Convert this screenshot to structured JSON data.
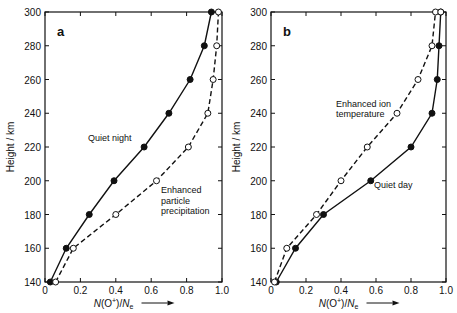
{
  "chart_data": [
    {
      "type": "line",
      "panel": "a",
      "xlabel": "N(O+)/Ne",
      "ylabel": "Height / km",
      "xlim": [
        0,
        1.0
      ],
      "ylim": [
        140,
        300
      ],
      "xticks": [
        "0",
        "0.2",
        "0.4",
        "0.6",
        "0.8",
        "1.0"
      ],
      "yticks": [
        "140",
        "160",
        "180",
        "200",
        "220",
        "240",
        "260",
        "280",
        "300"
      ],
      "series": [
        {
          "name": "Quiet night",
          "style": "solid",
          "marker": "filled",
          "y": [
            140,
            160,
            180,
            200,
            220,
            240,
            260,
            280,
            300
          ],
          "x": [
            0.03,
            0.12,
            0.25,
            0.39,
            0.56,
            0.7,
            0.82,
            0.9,
            0.94
          ]
        },
        {
          "name": "Enhanced particle precipitation",
          "style": "dashed",
          "marker": "open",
          "y": [
            140,
            160,
            180,
            200,
            220,
            240,
            260,
            280,
            300
          ],
          "x": [
            0.06,
            0.16,
            0.4,
            0.63,
            0.81,
            0.92,
            0.95,
            0.97,
            0.98
          ]
        }
      ],
      "annotations": [
        {
          "text": "Quiet night",
          "x": 0.34,
          "y": 224
        },
        {
          "text": "Enhanced particle precipitation",
          "x": 0.64,
          "y": 196
        }
      ]
    },
    {
      "type": "line",
      "panel": "b",
      "xlabel": "N(O+)/Ne",
      "ylabel": "Height / km",
      "xlim": [
        0,
        1.0
      ],
      "ylim": [
        140,
        300
      ],
      "xticks": [
        "0",
        "0.2",
        "0.4",
        "0.6",
        "0.8",
        "1.0"
      ],
      "yticks": [
        "140",
        "160",
        "180",
        "200",
        "220",
        "240",
        "260",
        "280",
        "300"
      ],
      "series": [
        {
          "name": "Quiet day",
          "style": "solid",
          "marker": "filled",
          "y": [
            140,
            160,
            180,
            200,
            220,
            240,
            260,
            280,
            300
          ],
          "x": [
            0.03,
            0.14,
            0.3,
            0.57,
            0.8,
            0.92,
            0.95,
            0.96,
            0.97
          ]
        },
        {
          "name": "Enhanced ion temperature",
          "style": "dashed",
          "marker": "open",
          "y": [
            140,
            160,
            180,
            200,
            220,
            240,
            260,
            280,
            300
          ],
          "x": [
            0.02,
            0.09,
            0.26,
            0.4,
            0.55,
            0.72,
            0.84,
            0.92,
            0.94
          ]
        }
      ],
      "annotations": [
        {
          "text": "Quiet day",
          "x": 0.6,
          "y": 199
        },
        {
          "text": "Enhanced ion temperature",
          "x": 0.4,
          "y": 243
        }
      ]
    }
  ],
  "panels": [
    {
      "label": "a",
      "ylabel": "Height / km",
      "xlabel_main": "N(O",
      "xlabel_sup": "+",
      "xlabel_tail": ")/N",
      "xlabel_sub": "e",
      "note1": "Quiet night",
      "note2a": "Enhanced",
      "note2b": "particle",
      "note2c": "precipitation"
    },
    {
      "label": "b",
      "ylabel": "Height / km",
      "xlabel_main": "N(O",
      "xlabel_sup": "+",
      "xlabel_tail": ")/N",
      "xlabel_sub": "e",
      "note1": "Quiet day",
      "note2a": "Enhanced ion",
      "note2b": "temperature"
    }
  ]
}
